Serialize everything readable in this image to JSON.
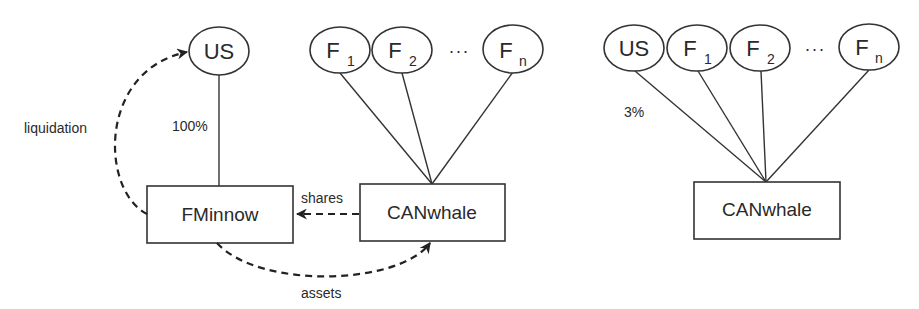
{
  "left_panel": {
    "nodes": {
      "us": {
        "label": "US"
      },
      "f1": {
        "base": "F",
        "sub": "1"
      },
      "f2": {
        "base": "F",
        "sub": "2"
      },
      "ellipsis": "···",
      "fn": {
        "base": "F",
        "sub": "n"
      }
    },
    "boxes": {
      "fminnow": "FMinnow",
      "canwhale": "CANwhale"
    },
    "edge_labels": {
      "us_stake": "100%"
    },
    "flows": {
      "liquidation": "liquidation",
      "shares": "shares",
      "assets": "assets"
    }
  },
  "right_panel": {
    "nodes": {
      "us": {
        "label": "US"
      },
      "f1": {
        "base": "F",
        "sub": "1"
      },
      "f2": {
        "base": "F",
        "sub": "2"
      },
      "ellipsis": "···",
      "fn": {
        "base": "F",
        "sub": "n"
      }
    },
    "boxes": {
      "canwhale": "CANwhale"
    },
    "edge_labels": {
      "us_stake": "3%"
    }
  },
  "colors": {
    "stroke": "#333333",
    "text": "#2a2a2a",
    "background": "#ffffff"
  }
}
